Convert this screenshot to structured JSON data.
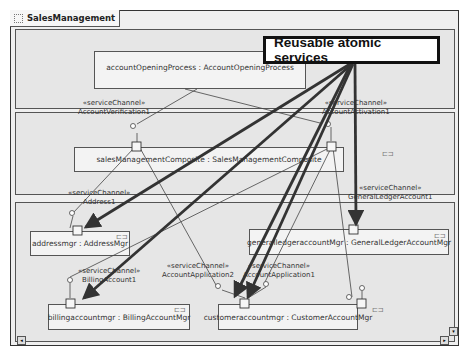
{
  "diagram": {
    "title": "SalesManagement",
    "callout": "Reusable atomic services",
    "components": {
      "accountOpeningProcess": "accountOpeningProcess : AccountOpeningProcess",
      "salesManagementComposite": "salesManagementComposite : SalesManagementComposite",
      "addressmgr": "addressmgr : AddressMgr",
      "generalledgeraccountmgr": "generalledgeraccountMgr : GeneralLedgerAccountMgr",
      "billingaccountmgr": "billingaccountmgr : BillingAccountMgr",
      "customeraccountmgr": "customeraccountmgr : CustomerAccountMgr"
    },
    "channels": [
      {
        "stereotype": "«serviceChannel»",
        "name": "AccountVerification1"
      },
      {
        "stereotype": "«serviceChannel»",
        "name": "AccountActivation1"
      },
      {
        "stereotype": "«serviceChannel»",
        "name": "Address1"
      },
      {
        "stereotype": "«serviceChannel»",
        "name": "GeneralLedgerAccount1"
      },
      {
        "stereotype": "«serviceChannel»",
        "name": "BillingAccount1"
      },
      {
        "stereotype": "«serviceChannel»",
        "name": "AccountApplication2"
      },
      {
        "stereotype": "«serviceChannel»",
        "name": "AccountApplication1"
      }
    ],
    "component_icon": "component-icon",
    "scroll": {
      "down": "▾",
      "right": "▸",
      "left": "◂"
    }
  }
}
